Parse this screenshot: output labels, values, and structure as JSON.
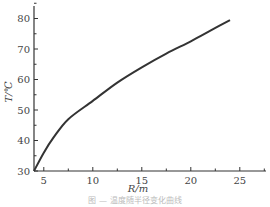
{
  "chart_data": {
    "type": "line",
    "title": "",
    "xlabel": "R/m",
    "ylabel": "T/℃",
    "xlim": [
      4,
      27
    ],
    "ylim": [
      30,
      85
    ],
    "grid": false,
    "legend": null,
    "x_ticks": [
      5,
      10,
      15,
      20,
      25
    ],
    "y_ticks": [
      30,
      40,
      50,
      60,
      70,
      80
    ],
    "series": [
      {
        "name": "T vs R",
        "x": [
          4,
          5,
          6,
          7.5,
          10,
          12.5,
          15,
          17.5,
          20,
          22,
          24
        ],
        "y": [
          30,
          36,
          41,
          47,
          53,
          59,
          64,
          68.5,
          72.5,
          76,
          79.5
        ]
      }
    ]
  },
  "axes": {
    "xlabel": "R/m",
    "ylabel": "T/℃",
    "x_ticks": [
      "5",
      "10",
      "15",
      "20",
      "25"
    ],
    "y_ticks": [
      "30",
      "40",
      "50",
      "60",
      "70",
      "80"
    ]
  },
  "caption": "图 — 温度随半径变化曲线"
}
